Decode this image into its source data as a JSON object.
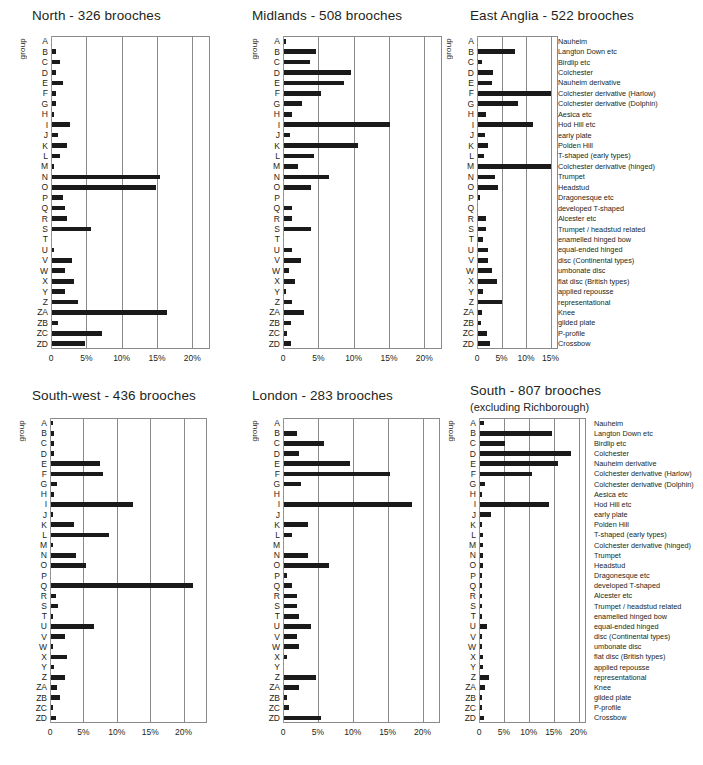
{
  "figure": {
    "axis_label": "group",
    "groups": [
      "A",
      "B",
      "C",
      "D",
      "E",
      "F",
      "G",
      "H",
      "I",
      "J",
      "K",
      "L",
      "M",
      "N",
      "O",
      "P",
      "Q",
      "R",
      "S",
      "T",
      "U",
      "V",
      "W",
      "X",
      "Y",
      "Z",
      "ZA",
      "ZB",
      "ZC",
      "ZD"
    ],
    "key": [
      "Nauheim",
      "Langton Down etc",
      "Birdlip etc",
      "Colchester",
      "Nauheim derivative",
      "Colchester derivative (Harlow)",
      "Colchester derivative (Dolphin)",
      "Aesica etc",
      "Hod Hill etc",
      "early plate",
      "Polden Hill",
      "T-shaped (early types)",
      "Colchester derivative (hinged)",
      "Trumpet",
      "Headstud",
      "Dragonesque etc",
      "developed T-shaped",
      "Alcester etc",
      "Trumpet / headstud related",
      "enamelled hinged bow",
      "equal-ended hinged",
      "disc (Continental types)",
      "umbonate disc",
      "flat disc (British types)",
      "applied repousse",
      "representational",
      "Knee",
      "gilded plate",
      "P-profile",
      "Crossbow"
    ],
    "bar_color": "#1a1a1a",
    "axis_color": "#8a8a8a"
  },
  "chart_data": [
    {
      "type": "bar",
      "title": "North - 326 brooches",
      "subtitle": "",
      "region": "North",
      "total": 326,
      "xlabel": "",
      "ylabel": "group",
      "xlim": [
        0,
        22.5
      ],
      "ticks": [
        0,
        5,
        10,
        15,
        20
      ],
      "tick_labels": [
        "0",
        "5%",
        "10%",
        "15%",
        "20%"
      ],
      "grid": true,
      "show_key": false,
      "categories": [
        "A",
        "B",
        "C",
        "D",
        "E",
        "F",
        "G",
        "H",
        "I",
        "J",
        "K",
        "L",
        "M",
        "N",
        "O",
        "P",
        "Q",
        "R",
        "S",
        "T",
        "U",
        "V",
        "W",
        "X",
        "Y",
        "Z",
        "ZA",
        "ZB",
        "ZC",
        "ZD"
      ],
      "values": [
        0,
        0.6,
        1.2,
        0.6,
        1.5,
        0.6,
        0.6,
        0.3,
        2.5,
        0.9,
        2.1,
        1.2,
        0.3,
        15.3,
        14.7,
        1.5,
        1.8,
        2.1,
        5.5,
        0,
        0.3,
        2.8,
        1.8,
        3.1,
        1.8,
        3.7,
        16.3,
        0.9,
        7.1,
        4.6
      ]
    },
    {
      "type": "bar",
      "title": "Midlands -  508 brooches",
      "subtitle": "",
      "region": "Midlands",
      "total": 508,
      "xlabel": "",
      "ylabel": "group",
      "xlim": [
        0,
        22.5
      ],
      "ticks": [
        0,
        5,
        10,
        15,
        20
      ],
      "tick_labels": [
        "0",
        "5%",
        "10%",
        "15%",
        "20%"
      ],
      "grid": true,
      "show_key": false,
      "categories": [
        "A",
        "B",
        "C",
        "D",
        "E",
        "F",
        "G",
        "H",
        "I",
        "J",
        "K",
        "L",
        "M",
        "N",
        "O",
        "P",
        "Q",
        "R",
        "S",
        "T",
        "U",
        "V",
        "W",
        "X",
        "Y",
        "Z",
        "ZA",
        "ZB",
        "ZC",
        "ZD"
      ],
      "values": [
        0.2,
        4.5,
        3.7,
        9.5,
        8.5,
        5.2,
        2.6,
        1.2,
        15.0,
        0.9,
        10.5,
        4.3,
        2.0,
        6.4,
        3.8,
        0,
        1.2,
        1.1,
        3.8,
        0,
        1.1,
        2.4,
        0.7,
        1.5,
        0.3,
        1.1,
        2.9,
        1.0,
        0.4,
        1.0
      ]
    },
    {
      "type": "bar",
      "title": "East Anglia - 522 brooches",
      "subtitle": "",
      "region": "East Anglia",
      "total": 522,
      "xlabel": "",
      "ylabel": "group",
      "xlim": [
        0,
        16.5
      ],
      "ticks": [
        0,
        5,
        10,
        15
      ],
      "tick_labels": [
        "0",
        "5%",
        "10%",
        "15%"
      ],
      "grid": true,
      "show_key": true,
      "categories": [
        "A",
        "B",
        "C",
        "D",
        "E",
        "F",
        "G",
        "H",
        "I",
        "J",
        "K",
        "L",
        "M",
        "N",
        "O",
        "P",
        "Q",
        "R",
        "S",
        "T",
        "U",
        "V",
        "W",
        "X",
        "Y",
        "Z",
        "ZA",
        "ZB",
        "ZC",
        "ZD"
      ],
      "values": [
        0,
        7.6,
        0.8,
        3.0,
        2.8,
        14.8,
        8.1,
        1.7,
        11.3,
        1.4,
        2.1,
        1.2,
        14.9,
        3.4,
        4.1,
        0.4,
        0,
        1.7,
        1.6,
        1.1,
        2.1,
        2.1,
        2.8,
        3.8,
        1.0,
        4.8,
        0.8,
        0.7,
        1.9,
        2.4
      ]
    },
    {
      "type": "bar",
      "title": "South-west - 436 brooches",
      "subtitle": "",
      "region": "South-west",
      "total": 436,
      "xlabel": "",
      "ylabel": "group",
      "xlim": [
        0,
        23.5
      ],
      "ticks": [
        0,
        5,
        10,
        15,
        20
      ],
      "tick_labels": [
        "0",
        "5%",
        "10%",
        "15%",
        "20%"
      ],
      "grid": true,
      "show_key": false,
      "categories": [
        "A",
        "B",
        "C",
        "D",
        "E",
        "F",
        "G",
        "H",
        "I",
        "J",
        "K",
        "L",
        "M",
        "N",
        "O",
        "P",
        "Q",
        "R",
        "S",
        "T",
        "U",
        "V",
        "W",
        "X",
        "Y",
        "Z",
        "ZA",
        "ZB",
        "ZC",
        "ZD"
      ],
      "values": [
        0.2,
        0.5,
        0.4,
        0.5,
        7.3,
        7.8,
        0.9,
        0.5,
        12.2,
        0.3,
        3.4,
        8.7,
        0.3,
        3.7,
        5.2,
        0,
        21.3,
        0.7,
        1.1,
        0.2,
        6.4,
        2.1,
        0.2,
        2.4,
        0.5,
        2.1,
        0.9,
        1.4,
        0.3,
        0.8
      ]
    },
    {
      "type": "bar",
      "title": "London - 283 brooches",
      "subtitle": "",
      "region": "London",
      "total": 283,
      "xlabel": "",
      "ylabel": "group",
      "xlim": [
        0,
        22.5
      ],
      "ticks": [
        0,
        5,
        10,
        15,
        20
      ],
      "tick_labels": [
        "0",
        "5%",
        "10%",
        "15%",
        "20%"
      ],
      "grid": true,
      "show_key": false,
      "categories": [
        "A",
        "B",
        "C",
        "D",
        "E",
        "F",
        "G",
        "H",
        "I",
        "J",
        "K",
        "L",
        "M",
        "N",
        "O",
        "P",
        "Q",
        "R",
        "S",
        "T",
        "U",
        "V",
        "W",
        "X",
        "Y",
        "Z",
        "ZA",
        "ZB",
        "ZC",
        "ZD"
      ],
      "values": [
        0,
        1.8,
        5.7,
        2.1,
        9.5,
        15.2,
        2.5,
        0,
        18.4,
        0,
        3.5,
        1.1,
        0,
        3.5,
        6.4,
        0.4,
        1.1,
        1.8,
        1.8,
        2.1,
        3.9,
        1.8,
        2.1,
        0.4,
        0,
        4.6,
        2.1,
        0.4,
        0.7,
        5.3
      ]
    },
    {
      "type": "bar",
      "title": "South - 807 brooches",
      "subtitle": "(excluding Richborough)",
      "region": "South",
      "total": 807,
      "xlabel": "",
      "ylabel": "group",
      "xlim": [
        0,
        21.5
      ],
      "ticks": [
        0,
        5,
        10,
        15,
        20
      ],
      "tick_labels": [
        "0",
        "5%",
        "10%",
        "15%",
        "20%"
      ],
      "grid": true,
      "show_key": true,
      "categories": [
        "A",
        "B",
        "C",
        "D",
        "E",
        "F",
        "G",
        "H",
        "I",
        "J",
        "K",
        "L",
        "M",
        "N",
        "O",
        "P",
        "Q",
        "R",
        "S",
        "T",
        "U",
        "V",
        "W",
        "X",
        "Y",
        "Z",
        "ZA",
        "ZB",
        "ZC",
        "ZD"
      ],
      "values": [
        0.9,
        14.4,
        5.0,
        18.3,
        15.6,
        10.5,
        1.1,
        0.2,
        13.8,
        2.2,
        0.4,
        0.6,
        0.6,
        0.6,
        0.6,
        0.3,
        0.3,
        0.3,
        0.3,
        0.3,
        1.5,
        0.3,
        0.2,
        0.7,
        0.7,
        1.8,
        1.0,
        0.4,
        0.3,
        0.8
      ]
    }
  ]
}
